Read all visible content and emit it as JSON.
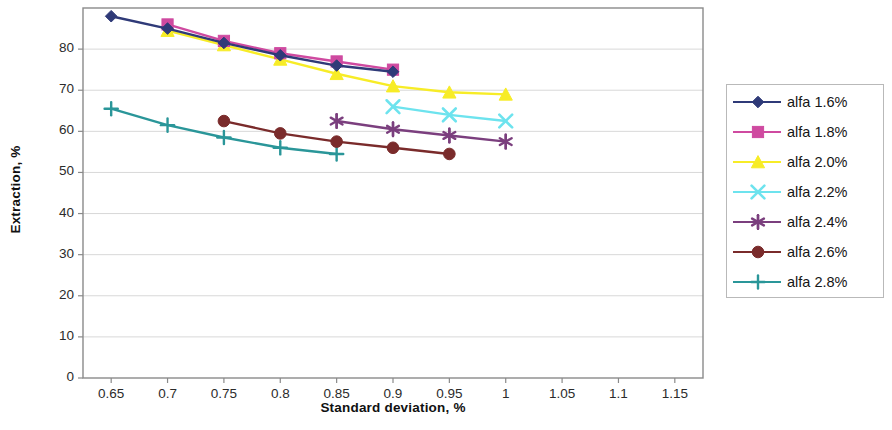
{
  "chart_data": {
    "type": "line",
    "title": "",
    "xlabel": "Standard deviation, %",
    "ylabel": "Extraction, %",
    "xlim": [
      0.625,
      1.175
    ],
    "ylim": [
      0,
      90
    ],
    "xticks": [
      "0.65",
      "0.7",
      "0.75",
      "0.8",
      "0.85",
      "0.9",
      "0.95",
      "1",
      "1.05",
      "1.1",
      "1.15"
    ],
    "xtick_values": [
      0.65,
      0.7,
      0.75,
      0.8,
      0.85,
      0.9,
      0.95,
      1.0,
      1.05,
      1.1,
      1.15
    ],
    "yticks": [
      "0",
      "10",
      "20",
      "30",
      "40",
      "50",
      "60",
      "70",
      "80"
    ],
    "ytick_values": [
      0,
      10,
      20,
      30,
      40,
      50,
      60,
      70,
      80
    ],
    "grid": "horizontal",
    "legend_position": "right",
    "series": [
      {
        "name": "alfa 1.6%",
        "marker": "diamond",
        "color": "#2f3a78",
        "x": [
          0.65,
          0.7,
          0.75,
          0.8,
          0.85,
          0.9
        ],
        "values": [
          88.0,
          85.0,
          81.5,
          78.5,
          76.0,
          74.5
        ]
      },
      {
        "name": "alfa 1.8%",
        "marker": "square",
        "color": "#cf4aa0",
        "x": [
          0.7,
          0.75,
          0.8,
          0.85,
          0.9
        ],
        "values": [
          86.0,
          82.0,
          79.0,
          77.0,
          75.0
        ]
      },
      {
        "name": "alfa 2.0%",
        "marker": "triangle",
        "color": "#f7ec27",
        "x": [
          0.7,
          0.75,
          0.8,
          0.85,
          0.9,
          0.95,
          1.0
        ],
        "values": [
          84.5,
          81.0,
          77.5,
          74.0,
          71.0,
          69.5,
          69.0
        ]
      },
      {
        "name": "alfa 2.2%",
        "marker": "x",
        "color": "#6de3ee",
        "x": [
          0.9,
          0.95,
          1.0
        ],
        "values": [
          66.0,
          64.0,
          62.5
        ]
      },
      {
        "name": "alfa 2.4%",
        "marker": "asterisk",
        "color": "#7b3f7e",
        "x": [
          0.85,
          0.9,
          0.95,
          1.0
        ],
        "values": [
          62.5,
          60.5,
          59.0,
          57.5
        ]
      },
      {
        "name": "alfa 2.6%",
        "marker": "circle",
        "color": "#7a2b2b",
        "x": [
          0.75,
          0.8,
          0.85,
          0.9,
          0.95
        ],
        "values": [
          62.5,
          59.5,
          57.5,
          56.0,
          54.5
        ]
      },
      {
        "name": "alfa 2.8%",
        "marker": "plus",
        "color": "#2a9699",
        "x": [
          0.65,
          0.7,
          0.75,
          0.8,
          0.85
        ],
        "values": [
          65.5,
          61.5,
          58.5,
          56.0,
          54.5
        ]
      }
    ]
  },
  "legend": {
    "items": [
      {
        "label": "alfa 1.6%"
      },
      {
        "label": "alfa 1.8%"
      },
      {
        "label": "alfa 2.0%"
      },
      {
        "label": "alfa 2.2%"
      },
      {
        "label": "alfa 2.4%"
      },
      {
        "label": "alfa 2.6%"
      },
      {
        "label": "alfa 2.8%"
      }
    ]
  },
  "plot_area": {
    "left": 83,
    "top": 8,
    "right": 703,
    "bottom": 378
  }
}
